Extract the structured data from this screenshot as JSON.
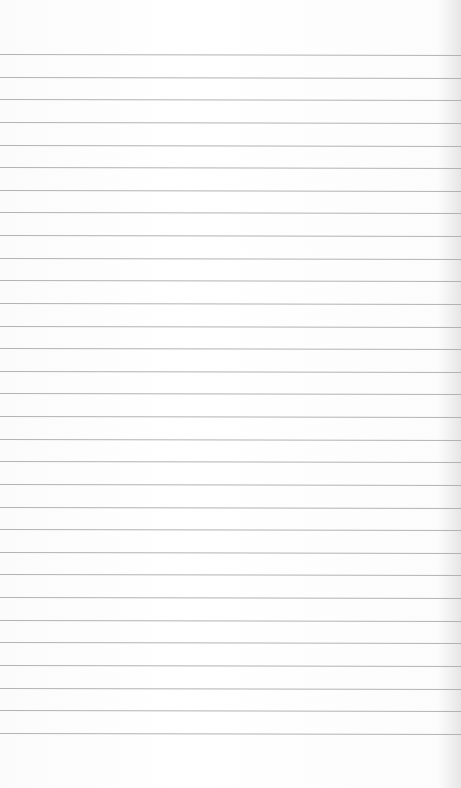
{
  "paper": {
    "type": "lined-paper",
    "line_count": 31,
    "first_line_y": 54,
    "line_spacing": 22.63,
    "line_color": "#b3b3b3",
    "background_color": "#fdfdfd"
  }
}
